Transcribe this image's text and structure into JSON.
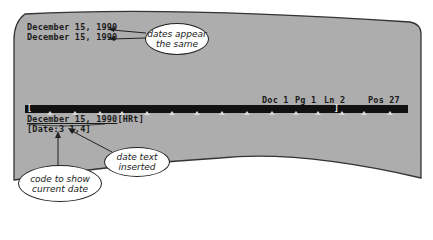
{
  "screen": {
    "lines": [
      "December 15, 1990",
      "December 15, 1990"
    ],
    "status_bar": {
      "doc": "Doc 1",
      "pg": "Pg 1",
      "ln": "Ln 2",
      "pos": "Pos 27"
    },
    "ruler": {
      "left_marker": "[",
      "right_marker": "]",
      "tab_positions_px": [
        50,
        75,
        100,
        122,
        147,
        172,
        197,
        222,
        247,
        272,
        296,
        318,
        342,
        364,
        390
      ]
    },
    "reveal_codes": {
      "date_text": "December 15, 1990",
      "hrt_code": "[HRt]",
      "date_code": "[Date:3 1,4]"
    }
  },
  "callouts": {
    "dates_same": {
      "line1": "dates appear",
      "line2": "the same"
    },
    "date_inserted": {
      "line1": "date text",
      "line2": "inserted"
    },
    "code_date": {
      "line1": "code to show",
      "line2": "current date"
    }
  },
  "colors": {
    "screen_bg": "#adadad",
    "screen_border": "#333333",
    "ruler_bg": "#111111",
    "text": "#1a1a1a"
  }
}
